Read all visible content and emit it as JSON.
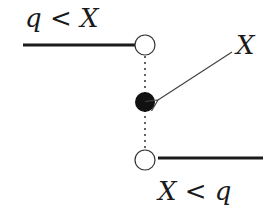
{
  "diagram": {
    "labels": {
      "top_left": "q < X",
      "right": "X",
      "bottom_right": "X < q"
    },
    "colors": {
      "stroke": "#1a1a1a",
      "filled_point": "#111111",
      "open_point": "#ffffff"
    }
  }
}
